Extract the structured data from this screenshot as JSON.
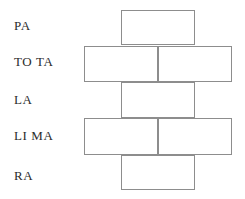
{
  "diagram": {
    "line_color": "#8d8d8d",
    "text_color": "#2b2b2b",
    "background": "#ffffff",
    "rows": [
      {
        "label": "PA",
        "syllables": 1,
        "cells": [
          ""
        ]
      },
      {
        "label": "TO TA",
        "syllables": 2,
        "cells": [
          "",
          ""
        ]
      },
      {
        "label": "LA",
        "syllables": 1,
        "cells": [
          ""
        ]
      },
      {
        "label": "LI MA",
        "syllables": 2,
        "cells": [
          "",
          ""
        ]
      },
      {
        "label": "RA",
        "syllables": 1,
        "cells": [
          ""
        ]
      }
    ]
  }
}
